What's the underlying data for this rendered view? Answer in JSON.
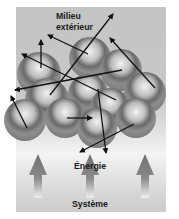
{
  "diagram": {
    "labels": {
      "environment_line1": "Milieu",
      "environment_line2": "extérieur",
      "energy": "Énergie",
      "system": "Système"
    },
    "elements": {
      "particles": {
        "count": 11,
        "shape": "sphere",
        "color": "#8c8c8c"
      },
      "motion_arrows": {
        "count": 11,
        "color": "#111111",
        "meaning": "random particle motion"
      },
      "energy_arrows": {
        "count": 3,
        "direction": "up",
        "color": "#7a7a7a"
      }
    },
    "colors": {
      "background": "#c6c6c6",
      "sphere_dark": "#6e6e6e",
      "sphere_light": "#e8e8e8",
      "arrow": "#111111",
      "text": "#1a1a1a"
    }
  }
}
